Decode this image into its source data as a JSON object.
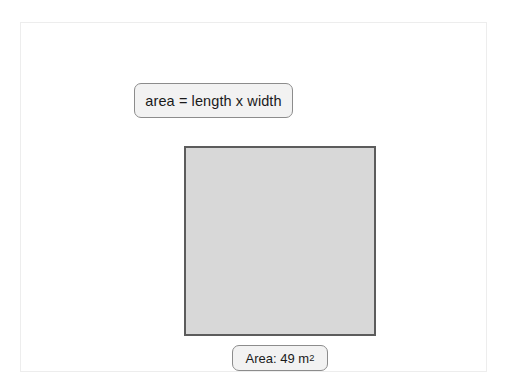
{
  "canvas": {
    "background_color": "#ffffff",
    "panel": {
      "background_color": "#ffffff",
      "border_color": "#ededed"
    }
  },
  "formula_label": {
    "text": "area = length x width",
    "fill_color": "#f2f2f2",
    "border_color": "#8c8c8c"
  },
  "shape": {
    "name": "square",
    "fill_color": "#d8d8d8",
    "border_color": "#5c5c5c"
  },
  "area_label": {
    "prefix": "Area: 49 m",
    "exponent": "2",
    "full_text": "Area: 49 m²",
    "fill_color": "#f2f2f2",
    "border_color": "#8c8c8c"
  }
}
